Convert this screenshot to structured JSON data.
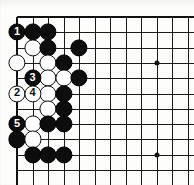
{
  "diagram": {
    "kind": "go-board-diagram",
    "board": {
      "columns": 12,
      "rows": 11,
      "origin_x": 17,
      "origin_y": 17,
      "step_x": 15.5,
      "step_y": 15.3,
      "line_color": "#1a1a1a",
      "background_color": "#fdfdfb",
      "edge_left": true,
      "edge_top": true,
      "edge_right": false,
      "edge_bottom": false
    },
    "star_points": [
      {
        "col": 4,
        "row": 4
      },
      {
        "col": 10,
        "row": 4
      },
      {
        "col": 4,
        "row": 10
      },
      {
        "col": 10,
        "row": 10
      }
    ],
    "stone_radius": 8.6,
    "stones": [
      {
        "col": 1,
        "row": 2,
        "color": "black",
        "label": "1"
      },
      {
        "col": 2,
        "row": 2,
        "color": "black",
        "label": ""
      },
      {
        "col": 3,
        "row": 2,
        "color": "black",
        "label": ""
      },
      {
        "col": 2,
        "row": 3,
        "color": "white",
        "label": ""
      },
      {
        "col": 3,
        "row": 3,
        "color": "black",
        "label": ""
      },
      {
        "col": 5,
        "row": 3,
        "color": "black",
        "label": ""
      },
      {
        "col": 1,
        "row": 4,
        "color": "white",
        "label": ""
      },
      {
        "col": 3,
        "row": 4,
        "color": "white",
        "label": ""
      },
      {
        "col": 4,
        "row": 4,
        "color": "black",
        "label": ""
      },
      {
        "col": 2,
        "row": 5,
        "color": "black",
        "label": "3"
      },
      {
        "col": 3,
        "row": 5,
        "color": "white",
        "label": ""
      },
      {
        "col": 4,
        "row": 5,
        "color": "white",
        "label": ""
      },
      {
        "col": 5,
        "row": 5,
        "color": "black",
        "label": ""
      },
      {
        "col": 1,
        "row": 6,
        "color": "white",
        "label": "2"
      },
      {
        "col": 2,
        "row": 6,
        "color": "white",
        "label": "4"
      },
      {
        "col": 3,
        "row": 6,
        "color": "white",
        "label": ""
      },
      {
        "col": 4,
        "row": 6,
        "color": "black",
        "label": ""
      },
      {
        "col": 3,
        "row": 7,
        "color": "white",
        "label": ""
      },
      {
        "col": 4,
        "row": 7,
        "color": "black",
        "label": ""
      },
      {
        "col": 1,
        "row": 8,
        "color": "black",
        "label": "5"
      },
      {
        "col": 2,
        "row": 8,
        "color": "white",
        "label": ""
      },
      {
        "col": 3,
        "row": 8,
        "color": "black",
        "label": ""
      },
      {
        "col": 4,
        "row": 8,
        "color": "black",
        "label": ""
      },
      {
        "col": 1,
        "row": 9,
        "color": "black",
        "label": ""
      },
      {
        "col": 2,
        "row": 9,
        "color": "white",
        "label": ""
      },
      {
        "col": 2,
        "row": 10,
        "color": "black",
        "label": ""
      },
      {
        "col": 3,
        "row": 10,
        "color": "black",
        "label": ""
      },
      {
        "col": 4,
        "row": 10,
        "color": "black",
        "label": ""
      }
    ],
    "move_labels": [
      "1",
      "2",
      "3",
      "4",
      "5"
    ]
  }
}
